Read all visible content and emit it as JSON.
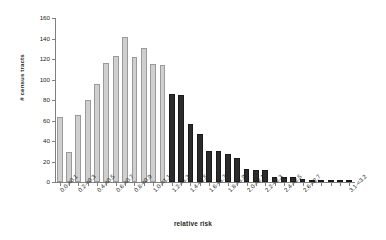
{
  "chart_data": {
    "type": "bar",
    "title": "",
    "xlabel": "relative risk",
    "ylabel": "# census tracts",
    "ylim": [
      0,
      160
    ],
    "yticks": [
      0,
      20,
      40,
      60,
      80,
      100,
      120,
      140,
      160
    ],
    "grid": false,
    "legend": "none",
    "bar_colors": {
      "low": "#cfcfcf",
      "high": "#2b2b2b"
    },
    "color_split_note": "bars with relative risk below 1.2 are light gray; 1.2 and above are dark gray",
    "categories": [
      "0.0-<0.1",
      "0.1-<0.2",
      "0.2-<0.3",
      "0.3-<0.4",
      "0.4-<0.5",
      "0.5-<0.6",
      "0.6-<0.7",
      "0.7-<0.8",
      "0.8-<0.9",
      "0.9-<1.0",
      "1.0-<1.1",
      "1.1-<1.2",
      "1.2-<1.3",
      "1.3-<1.4",
      "1.4-<1.5",
      "1.5-<1.6",
      "1.6-<1.7",
      "1.7-<1.8",
      "1.8-<1.9",
      "1.9-<2.0",
      "2.0-<2.1",
      "2.1-<2.2",
      "2.2-<2.3",
      "2.3-<2.4",
      "2.4-<2.5",
      "2.5-<2.6",
      "2.6-<2.7",
      "2.7-<2.8",
      "2.8-<2.9",
      "2.9-<3.0",
      "3.0-<3.1",
      "3.1-<3.2"
    ],
    "tick_labels_shown": [
      "0.0-<0.1",
      "0.2-<0.3",
      "0.4-<0.5",
      "0.6-<0.7",
      "0.8-<0.9",
      "1.0-<1.1",
      "1.2-<1.3",
      "1.4-<1.5",
      "1.6-<1.7",
      "1.8-<1.9",
      "2.0-<2.1",
      "2.2-<2.3",
      "2.4-<2.5",
      "2.6-<2.7",
      "3.1-<3.2"
    ],
    "values": [
      63,
      29,
      65,
      80,
      96,
      116,
      123,
      141,
      122,
      131,
      115,
      114,
      86,
      85,
      57,
      47,
      30,
      30,
      27,
      23,
      13,
      12,
      12,
      5,
      5,
      5,
      3,
      2,
      1,
      1,
      1,
      1
    ]
  }
}
